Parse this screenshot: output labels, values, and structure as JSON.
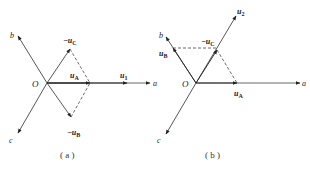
{
  "diagram_a": {
    "caption": "( a )",
    "origin_label": "O",
    "axes": {
      "a": "a",
      "b": "b",
      "c": "c"
    },
    "vectors": {
      "neg_uC": {
        "prefix": "−",
        "main": "u",
        "sub": "C"
      },
      "neg_uB": {
        "prefix": "−",
        "main": "u",
        "sub": "B"
      },
      "uA": {
        "main": "u",
        "sub": "A"
      },
      "u1": {
        "main": "u",
        "sub": "1"
      }
    }
  },
  "diagram_b": {
    "caption": "( b )",
    "origin_label": "O",
    "axes": {
      "a": "a",
      "b": "b",
      "c": "c"
    },
    "vectors": {
      "neg_uC": {
        "prefix": "−",
        "main": "u",
        "sub": "C"
      },
      "uB": {
        "main": "u",
        "sub": "B"
      },
      "uA": {
        "main": "u",
        "sub": "A"
      },
      "u2": {
        "main": "u",
        "sub": "2"
      }
    }
  },
  "colors": {
    "line": "#333333",
    "dash": "#444444"
  }
}
